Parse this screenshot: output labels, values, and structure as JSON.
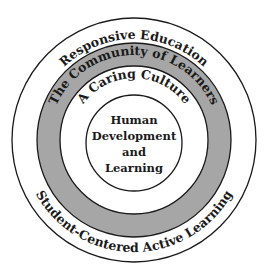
{
  "diagram": {
    "type": "concentric-circles",
    "colors": {
      "background": "#ffffff",
      "stroke": "#1a1a1a",
      "gray_band": "#a6a6a6"
    },
    "rings": [
      {
        "label_top": "Responsive Education",
        "label_bottom": "Student-Centered Active Learning"
      },
      {
        "label_top": "The Community of Learners"
      },
      {
        "label_top": "A Caring Culture"
      }
    ],
    "center": {
      "lines": [
        "Human",
        "Development",
        "and",
        "Learning"
      ]
    }
  }
}
